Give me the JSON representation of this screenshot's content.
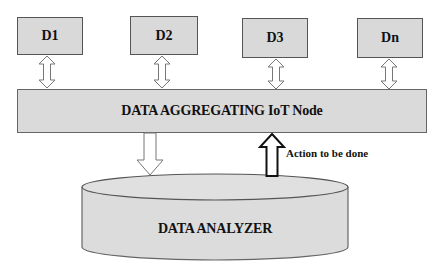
{
  "devices": [
    {
      "label": "D1"
    },
    {
      "label": "D2"
    },
    {
      "label": "D3"
    },
    {
      "label": "Dn"
    }
  ],
  "aggregator": {
    "label": "DATA AGGREGATING IoT Node"
  },
  "analyzer": {
    "label": "DATA ANALYZER"
  },
  "feedback": {
    "label": "Action to be done"
  },
  "colors": {
    "box_fill": "#d9d9d9",
    "box_border": "#555555",
    "arrow_fill": "#ffffff",
    "arrow_stroke": "#777777",
    "action_arrow_stroke": "#111111",
    "text": "#111111"
  }
}
